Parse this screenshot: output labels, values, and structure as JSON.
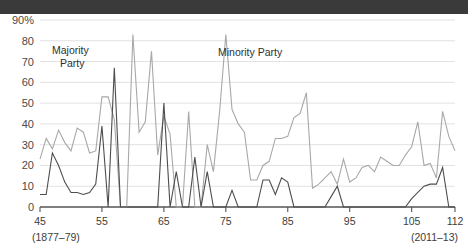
{
  "header": {
    "bar_text": "",
    "bar_color": "#3a3a3a"
  },
  "colors": {
    "majority": "#4d4d4d",
    "minority": "#a8a8a8",
    "grid": "#e2e2e2",
    "axis": "#555555",
    "text": "#3d3d3d"
  },
  "annotations": {
    "majority_label_line1": "Majority",
    "majority_label_line2": "Party",
    "minority_label": "Minority Party"
  },
  "axis": {
    "y_top_label": "90%",
    "y_ticks": [
      "90%",
      "80",
      "70",
      "60",
      "50",
      "40",
      "30",
      "20",
      "10",
      "0"
    ],
    "y_values": [
      90,
      80,
      70,
      60,
      50,
      40,
      30,
      20,
      10,
      0
    ],
    "x_ticks": [
      "45",
      "55",
      "65",
      "75",
      "85",
      "95",
      "105",
      "112"
    ],
    "x_tick_values": [
      45,
      55,
      65,
      75,
      85,
      95,
      105,
      112
    ],
    "x_start_era": "(1877–79)",
    "x_end_era": "(2011–13)"
  },
  "chart_data": {
    "type": "line",
    "title": "",
    "subtitle": "",
    "xlabel": "",
    "ylabel": "",
    "xlim": [
      45,
      112
    ],
    "ylim": [
      0,
      90
    ],
    "grid": true,
    "legend": "inline-annotations",
    "x": [
      45,
      46,
      47,
      48,
      49,
      50,
      51,
      52,
      53,
      54,
      55,
      56,
      57,
      58,
      59,
      60,
      61,
      62,
      63,
      64,
      65,
      66,
      67,
      68,
      69,
      70,
      71,
      72,
      73,
      74,
      75,
      76,
      77,
      78,
      79,
      80,
      81,
      82,
      83,
      84,
      85,
      86,
      87,
      88,
      89,
      90,
      91,
      92,
      93,
      94,
      95,
      96,
      97,
      98,
      99,
      100,
      101,
      102,
      103,
      104,
      105,
      106,
      107,
      108,
      109,
      110,
      111,
      112
    ],
    "series": [
      {
        "name": "Minority Party",
        "color": "#a8a8a8",
        "values": [
          23,
          33,
          28,
          37,
          31,
          27,
          38,
          36,
          26,
          27,
          53,
          53,
          42,
          0,
          0,
          83,
          36,
          41,
          75,
          25,
          44,
          35,
          0,
          0,
          46,
          0,
          0,
          30,
          17,
          46,
          83,
          47,
          40,
          36,
          13,
          13,
          20,
          22,
          33,
          33,
          34,
          43,
          45,
          55,
          9,
          11,
          14,
          17,
          11,
          23,
          12,
          14,
          19,
          20,
          17,
          24,
          22,
          20,
          20,
          25,
          29,
          41,
          20,
          21,
          14,
          46,
          34,
          27
        ]
      },
      {
        "name": "Majority Party",
        "color": "#4d4d4d",
        "values": [
          6,
          6,
          26,
          20,
          12,
          7,
          7,
          6,
          7,
          11,
          39,
          0,
          67,
          0,
          0,
          0,
          0,
          0,
          0,
          0,
          50,
          0,
          17,
          0,
          0,
          24,
          0,
          17,
          0,
          0,
          0,
          8,
          0,
          0,
          0,
          0,
          13,
          13,
          6,
          14,
          12,
          0,
          0,
          0,
          0,
          0,
          0,
          5,
          10,
          0,
          0,
          0,
          0,
          0,
          0,
          0,
          0,
          0,
          0,
          0,
          4,
          7,
          10,
          11,
          11,
          19,
          0,
          0
        ]
      }
    ]
  }
}
